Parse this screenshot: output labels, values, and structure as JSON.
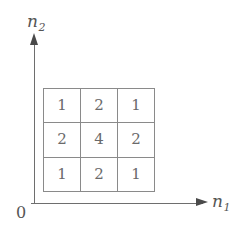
{
  "figure": {
    "background_color": "#ffffff",
    "axis_color": "#6e6e6e",
    "grid_line_color": "#8a8a8a",
    "text_color": "#555555",
    "cell_text_color": "#6a6a6a"
  },
  "axes": {
    "y_axis_label_base": "n",
    "y_axis_label_sub": "2",
    "x_axis_label_base": "n",
    "x_axis_label_sub": "1",
    "origin_label": "0",
    "y_axis_arrow_icon": "arrow-up-icon",
    "x_axis_arrow_icon": "arrow-right-icon"
  },
  "chart_data": {
    "type": "heatmap",
    "title": "",
    "subtitle": "",
    "xlabel": "n1",
    "ylabel": "n2",
    "grid": true,
    "legend": "none",
    "rows": 3,
    "cols": 3,
    "x": [
      0,
      1,
      2
    ],
    "y": [
      2,
      1,
      0
    ],
    "xticklabels": [],
    "yticklabels": [],
    "values": [
      [
        1,
        2,
        1
      ],
      [
        2,
        4,
        2
      ],
      [
        1,
        2,
        1
      ]
    ],
    "cells": [
      {
        "row": 0,
        "col": 0,
        "value": "1"
      },
      {
        "row": 0,
        "col": 1,
        "value": "2"
      },
      {
        "row": 0,
        "col": 2,
        "value": "1"
      },
      {
        "row": 1,
        "col": 0,
        "value": "2"
      },
      {
        "row": 1,
        "col": 1,
        "value": "4"
      },
      {
        "row": 1,
        "col": 2,
        "value": "2"
      },
      {
        "row": 2,
        "col": 0,
        "value": "1"
      },
      {
        "row": 2,
        "col": 1,
        "value": "2"
      },
      {
        "row": 2,
        "col": 2,
        "value": "1"
      }
    ],
    "annotations": []
  }
}
